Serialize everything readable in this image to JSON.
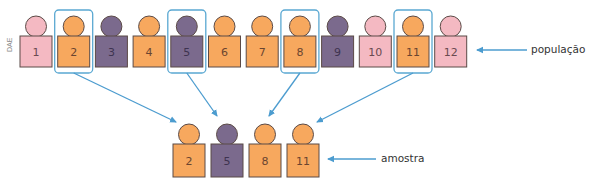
{
  "colors": {
    "pink": "#f4b9c2",
    "orange": "#f7a85e",
    "purple": "#7b6a8d",
    "outline": "#5b4a46",
    "highlight": "#5aa8d2",
    "arrow": "#4c9ccf",
    "text_pink": "#6a4a50",
    "text_orange": "#6a4530",
    "text_purple": "#3e3350"
  },
  "watermark": "DAE",
  "population": {
    "label": "população",
    "individuals": [
      {
        "number": "1",
        "color": "pink",
        "selected": false
      },
      {
        "number": "2",
        "color": "orange",
        "selected": true
      },
      {
        "number": "3",
        "color": "purple",
        "selected": false
      },
      {
        "number": "4",
        "color": "orange",
        "selected": false
      },
      {
        "number": "5",
        "color": "purple",
        "selected": true
      },
      {
        "number": "6",
        "color": "orange",
        "selected": false
      },
      {
        "number": "7",
        "color": "orange",
        "selected": false
      },
      {
        "number": "8",
        "color": "orange",
        "selected": true
      },
      {
        "number": "9",
        "color": "purple",
        "selected": false
      },
      {
        "number": "10",
        "color": "pink",
        "selected": false
      },
      {
        "number": "11",
        "color": "orange",
        "selected": true
      },
      {
        "number": "12",
        "color": "pink",
        "selected": false
      }
    ]
  },
  "sample": {
    "label": "amostra",
    "individuals": [
      {
        "number": "2",
        "color": "orange"
      },
      {
        "number": "5",
        "color": "purple"
      },
      {
        "number": "8",
        "color": "orange"
      },
      {
        "number": "11",
        "color": "orange"
      }
    ]
  }
}
